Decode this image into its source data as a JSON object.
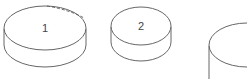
{
  "diagram": {
    "stroke_color": "#555555",
    "discs": [
      {
        "label": "1",
        "has_dashed_arc": true
      },
      {
        "label": "2",
        "has_dashed_arc": false
      },
      {
        "label": "",
        "has_dashed_arc": false,
        "partially_visible": true
      }
    ]
  }
}
